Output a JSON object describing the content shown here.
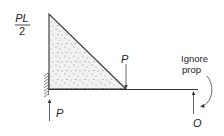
{
  "diagram": {
    "type": "bending-moment-diagram",
    "moment_label": {
      "numerator": "PL",
      "denominator": "2"
    },
    "loads": {
      "applied_load_label": "P",
      "left_reaction_label": "P",
      "right_reaction_label": "O"
    },
    "annotation": {
      "line1": "Ignore",
      "line2": "prop"
    },
    "colors": {
      "stroke": "#333333",
      "fill": "#ececec",
      "stipple": "#777777"
    }
  }
}
